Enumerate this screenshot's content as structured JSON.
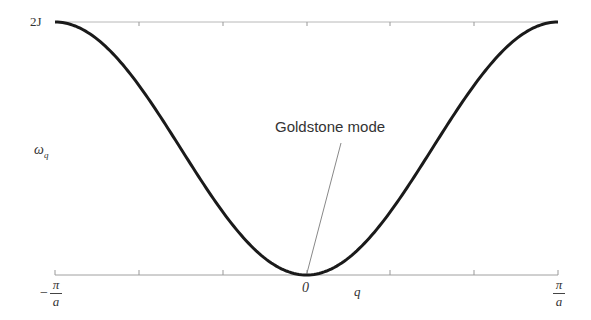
{
  "chart_data": {
    "type": "line",
    "title": "",
    "xlabel": "q",
    "ylabel": "ω_q",
    "x_ticks": [
      "-π/a",
      "0",
      "π/a"
    ],
    "y_ticks": [
      "2J"
    ],
    "xlim": [
      "-π/a",
      "π/a"
    ],
    "ylim": [
      0,
      "2J"
    ],
    "grid": false,
    "series": [
      {
        "name": "ω_q = J(1 - cos qa)",
        "x": [
          -1.0,
          -0.833,
          -0.667,
          -0.5,
          -0.333,
          -0.167,
          0.0,
          0.167,
          0.333,
          0.5,
          0.667,
          0.833,
          1.0
        ],
        "x_units": "π/a",
        "y": [
          2.0,
          1.866,
          1.5,
          1.0,
          0.5,
          0.134,
          0.0,
          0.134,
          0.5,
          1.0,
          1.5,
          1.866,
          2.0
        ],
        "y_units": "J"
      }
    ],
    "annotations": [
      {
        "text": "Goldstone mode",
        "points_to": {
          "x": 0,
          "y": 0
        }
      }
    ]
  },
  "labels": {
    "y_top": "2J",
    "y_axis": "ω",
    "y_axis_sub": "q",
    "x_left_num": "π",
    "x_left_den": "a",
    "x_left_sign": "−",
    "x_zero": "0",
    "x_axis": "q",
    "x_right_num": "π",
    "x_right_den": "a",
    "annotation": "Goldstone mode"
  }
}
